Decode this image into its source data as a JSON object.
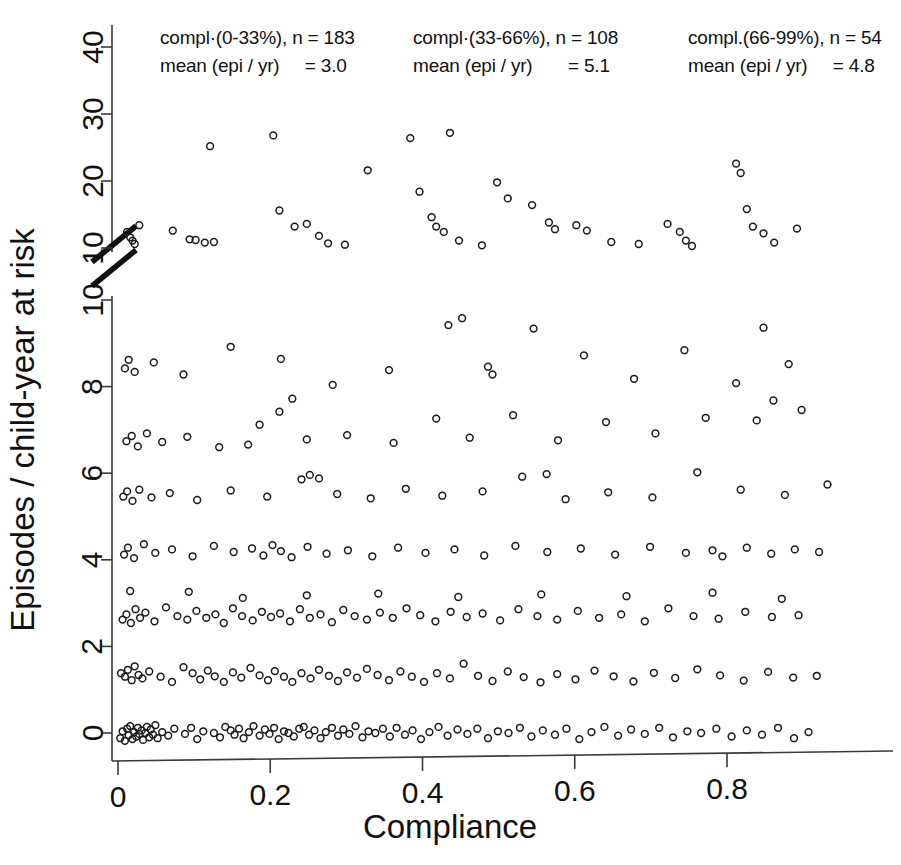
{
  "chart_data": {
    "type": "scatter",
    "title": "",
    "xlabel": "Compliance",
    "ylabel": "Episodes / child-year at risk",
    "xlim": [
      -0.03,
      1.0
    ],
    "xticks": [
      0,
      0.2,
      0.4,
      0.6,
      0.8
    ],
    "xticklabels": [
      "0",
      "0.2",
      "0.4",
      "0.6",
      "0.8"
    ],
    "ylim_lower": [
      0,
      10
    ],
    "ylim_upper": [
      10,
      42
    ],
    "yticks_lower": [
      0,
      2,
      4,
      6,
      8,
      10
    ],
    "yticklabels_lower": [
      "0",
      "2",
      "4",
      "6",
      "8",
      "10"
    ],
    "yticks_upper": [
      10,
      20,
      30,
      40
    ],
    "yticklabels_upper": [
      "10",
      "20",
      "30",
      "40"
    ],
    "axis_break": true,
    "axis_break_note": "broken y-axis between the lower 0-10 segment and the upper 10-40 segment",
    "grid": false,
    "legend": "none",
    "marker": "open-circle",
    "marker_size_px": 8,
    "groups": [
      {
        "name": "compl.(0-33%)",
        "label_line1": "compl·(0-33%), n = 183",
        "label_line2": "mean (epi / yr)     = 3.0",
        "n": 183,
        "mean_epi_per_yr": 3.0,
        "compliance_range": [
          0,
          0.33
        ]
      },
      {
        "name": "compl.(33-66%)",
        "label_line1": "compl·(33-66%), n = 108",
        "label_line2": "mean (epi / yr)       = 5.1",
        "n": 108,
        "mean_epi_per_yr": 5.1,
        "compliance_range": [
          0.33,
          0.66
        ]
      },
      {
        "name": "compl.(66-99%)",
        "label_line1": "compl.(66-99%), n = 54",
        "label_line2": "mean (epi / yr)     = 4.8",
        "n": 54,
        "mean_epi_per_yr": 4.8,
        "compliance_range": [
          0.66,
          0.99
        ]
      }
    ],
    "points": [
      [
        0.003,
        -0.12
      ],
      [
        0.006,
        0.04
      ],
      [
        0.009,
        -0.18
      ],
      [
        0.012,
        0.1
      ],
      [
        0.014,
        -0.05
      ],
      [
        0.016,
        0.16
      ],
      [
        0.019,
        -0.14
      ],
      [
        0.021,
        0.02
      ],
      [
        0.024,
        -0.08
      ],
      [
        0.026,
        0.12
      ],
      [
        0.028,
        -0.02
      ],
      [
        0.031,
        0.06
      ],
      [
        0.033,
        -0.16
      ],
      [
        0.036,
        0.0
      ],
      [
        0.038,
        0.14
      ],
      [
        0.041,
        -0.1
      ],
      [
        0.043,
        0.08
      ],
      [
        0.046,
        -0.04
      ],
      [
        0.049,
        0.18
      ],
      [
        0.052,
        -0.12
      ],
      [
        0.058,
        0.02
      ],
      [
        0.066,
        -0.06
      ],
      [
        0.074,
        0.1
      ],
      [
        0.088,
        -0.02
      ],
      [
        0.096,
        0.12
      ],
      [
        0.104,
        -0.14
      ],
      [
        0.112,
        0.04
      ],
      [
        0.126,
        0.0
      ],
      [
        0.134,
        -0.1
      ],
      [
        0.141,
        0.14
      ],
      [
        0.148,
        0.06
      ],
      [
        0.153,
        -0.04
      ],
      [
        0.159,
        0.1
      ],
      [
        0.165,
        -0.12
      ],
      [
        0.172,
        0.02
      ],
      [
        0.178,
        0.16
      ],
      [
        0.186,
        -0.06
      ],
      [
        0.193,
        0.08
      ],
      [
        0.199,
        -0.02
      ],
      [
        0.205,
        0.12
      ],
      [
        0.211,
        -0.14
      ],
      [
        0.218,
        0.04
      ],
      [
        0.224,
        0.0
      ],
      [
        0.231,
        -0.08
      ],
      [
        0.238,
        0.1
      ],
      [
        0.244,
        0.14
      ],
      [
        0.251,
        -0.04
      ],
      [
        0.258,
        0.06
      ],
      [
        0.266,
        -0.12
      ],
      [
        0.273,
        0.02
      ],
      [
        0.281,
        0.12
      ],
      [
        0.289,
        -0.06
      ],
      [
        0.296,
        0.08
      ],
      [
        0.304,
        -0.02
      ],
      [
        0.312,
        0.16
      ],
      [
        0.321,
        -0.1
      ],
      [
        0.329,
        0.04
      ],
      [
        0.338,
        0.0
      ],
      [
        0.348,
        0.1
      ],
      [
        0.357,
        -0.08
      ],
      [
        0.366,
        0.12
      ],
      [
        0.377,
        -0.04
      ],
      [
        0.387,
        0.06
      ],
      [
        0.398,
        -0.14
      ],
      [
        0.409,
        0.02
      ],
      [
        0.421,
        0.14
      ],
      [
        0.433,
        -0.06
      ],
      [
        0.446,
        0.08
      ],
      [
        0.459,
        -0.02
      ],
      [
        0.472,
        0.1
      ],
      [
        0.486,
        -0.12
      ],
      [
        0.499,
        0.04
      ],
      [
        0.513,
        0.0
      ],
      [
        0.528,
        0.12
      ],
      [
        0.543,
        -0.08
      ],
      [
        0.558,
        0.06
      ],
      [
        0.574,
        -0.04
      ],
      [
        0.589,
        0.1
      ],
      [
        0.606,
        -0.14
      ],
      [
        0.622,
        0.02
      ],
      [
        0.639,
        0.14
      ],
      [
        0.657,
        -0.06
      ],
      [
        0.674,
        0.08
      ],
      [
        0.692,
        -0.02
      ],
      [
        0.711,
        0.12
      ],
      [
        0.729,
        -0.1
      ],
      [
        0.748,
        0.04
      ],
      [
        0.766,
        0.0
      ],
      [
        0.786,
        0.1
      ],
      [
        0.806,
        -0.08
      ],
      [
        0.826,
        0.06
      ],
      [
        0.846,
        -0.04
      ],
      [
        0.867,
        0.12
      ],
      [
        0.888,
        -0.12
      ],
      [
        0.907,
        0.02
      ],
      [
        0.004,
        1.38
      ],
      [
        0.009,
        1.3
      ],
      [
        0.013,
        1.46
      ],
      [
        0.018,
        1.22
      ],
      [
        0.022,
        1.54
      ],
      [
        0.027,
        1.34
      ],
      [
        0.032,
        1.26
      ],
      [
        0.041,
        1.42
      ],
      [
        0.056,
        1.3
      ],
      [
        0.071,
        1.18
      ],
      [
        0.086,
        1.52
      ],
      [
        0.098,
        1.38
      ],
      [
        0.108,
        1.24
      ],
      [
        0.118,
        1.44
      ],
      [
        0.127,
        1.31
      ],
      [
        0.139,
        1.18
      ],
      [
        0.151,
        1.4
      ],
      [
        0.162,
        1.28
      ],
      [
        0.174,
        1.5
      ],
      [
        0.186,
        1.33
      ],
      [
        0.197,
        1.22
      ],
      [
        0.206,
        1.43
      ],
      [
        0.218,
        1.3
      ],
      [
        0.229,
        1.18
      ],
      [
        0.241,
        1.38
      ],
      [
        0.253,
        1.26
      ],
      [
        0.264,
        1.46
      ],
      [
        0.277,
        1.32
      ],
      [
        0.289,
        1.2
      ],
      [
        0.301,
        1.4
      ],
      [
        0.314,
        1.28
      ],
      [
        0.327,
        1.48
      ],
      [
        0.341,
        1.34
      ],
      [
        0.356,
        1.22
      ],
      [
        0.371,
        1.42
      ],
      [
        0.386,
        1.3
      ],
      [
        0.402,
        1.18
      ],
      [
        0.419,
        1.38
      ],
      [
        0.436,
        1.26
      ],
      [
        0.454,
        1.6
      ],
      [
        0.473,
        1.32
      ],
      [
        0.492,
        1.2
      ],
      [
        0.512,
        1.42
      ],
      [
        0.533,
        1.29
      ],
      [
        0.555,
        1.17
      ],
      [
        0.577,
        1.36
      ],
      [
        0.601,
        1.24
      ],
      [
        0.626,
        1.44
      ],
      [
        0.651,
        1.31
      ],
      [
        0.677,
        1.19
      ],
      [
        0.704,
        1.39
      ],
      [
        0.732,
        1.27
      ],
      [
        0.761,
        1.47
      ],
      [
        0.791,
        1.33
      ],
      [
        0.822,
        1.21
      ],
      [
        0.854,
        1.41
      ],
      [
        0.887,
        1.28
      ],
      [
        0.918,
        1.32
      ],
      [
        0.006,
        2.62
      ],
      [
        0.011,
        2.74
      ],
      [
        0.017,
        2.54
      ],
      [
        0.023,
        2.86
      ],
      [
        0.029,
        2.66
      ],
      [
        0.036,
        2.78
      ],
      [
        0.048,
        2.58
      ],
      [
        0.063,
        2.9
      ],
      [
        0.078,
        2.7
      ],
      [
        0.091,
        2.62
      ],
      [
        0.103,
        2.82
      ],
      [
        0.116,
        2.66
      ],
      [
        0.128,
        2.74
      ],
      [
        0.139,
        2.54
      ],
      [
        0.151,
        2.88
      ],
      [
        0.163,
        2.7
      ],
      [
        0.177,
        2.6
      ],
      [
        0.189,
        2.8
      ],
      [
        0.201,
        2.68
      ],
      [
        0.213,
        2.76
      ],
      [
        0.226,
        2.58
      ],
      [
        0.239,
        2.86
      ],
      [
        0.252,
        2.66
      ],
      [
        0.266,
        2.74
      ],
      [
        0.281,
        2.56
      ],
      [
        0.296,
        2.84
      ],
      [
        0.311,
        2.7
      ],
      [
        0.327,
        2.62
      ],
      [
        0.344,
        2.78
      ],
      [
        0.361,
        2.66
      ],
      [
        0.379,
        2.88
      ],
      [
        0.397,
        2.72
      ],
      [
        0.417,
        2.58
      ],
      [
        0.437,
        2.8
      ],
      [
        0.458,
        2.68
      ],
      [
        0.479,
        2.76
      ],
      [
        0.502,
        2.6
      ],
      [
        0.526,
        2.86
      ],
      [
        0.551,
        2.7
      ],
      [
        0.577,
        2.62
      ],
      [
        0.604,
        2.82
      ],
      [
        0.632,
        2.66
      ],
      [
        0.661,
        2.74
      ],
      [
        0.692,
        2.58
      ],
      [
        0.723,
        2.88
      ],
      [
        0.756,
        2.7
      ],
      [
        0.789,
        2.64
      ],
      [
        0.824,
        2.8
      ],
      [
        0.859,
        2.68
      ],
      [
        0.894,
        2.72
      ],
      [
        0.016,
        3.28
      ],
      [
        0.093,
        3.26
      ],
      [
        0.164,
        3.12
      ],
      [
        0.248,
        3.18
      ],
      [
        0.342,
        3.22
      ],
      [
        0.447,
        3.14
      ],
      [
        0.556,
        3.2
      ],
      [
        0.668,
        3.16
      ],
      [
        0.781,
        3.24
      ],
      [
        0.872,
        3.1
      ],
      [
        0.008,
        4.12
      ],
      [
        0.013,
        4.28
      ],
      [
        0.021,
        4.04
      ],
      [
        0.034,
        4.36
      ],
      [
        0.049,
        4.16
      ],
      [
        0.071,
        4.24
      ],
      [
        0.098,
        4.08
      ],
      [
        0.126,
        4.32
      ],
      [
        0.152,
        4.18
      ],
      [
        0.176,
        4.26
      ],
      [
        0.191,
        4.1
      ],
      [
        0.203,
        4.34
      ],
      [
        0.214,
        4.2
      ],
      [
        0.228,
        4.06
      ],
      [
        0.249,
        4.3
      ],
      [
        0.274,
        4.14
      ],
      [
        0.302,
        4.22
      ],
      [
        0.334,
        4.08
      ],
      [
        0.368,
        4.28
      ],
      [
        0.404,
        4.16
      ],
      [
        0.442,
        4.24
      ],
      [
        0.481,
        4.1
      ],
      [
        0.522,
        4.32
      ],
      [
        0.564,
        4.18
      ],
      [
        0.608,
        4.26
      ],
      [
        0.653,
        4.12
      ],
      [
        0.699,
        4.3
      ],
      [
        0.746,
        4.16
      ],
      [
        0.781,
        4.22
      ],
      [
        0.794,
        4.08
      ],
      [
        0.826,
        4.28
      ],
      [
        0.858,
        4.14
      ],
      [
        0.889,
        4.24
      ],
      [
        0.921,
        4.18
      ],
      [
        0.007,
        5.46
      ],
      [
        0.012,
        5.58
      ],
      [
        0.019,
        5.36
      ],
      [
        0.028,
        5.62
      ],
      [
        0.044,
        5.44
      ],
      [
        0.068,
        5.54
      ],
      [
        0.104,
        5.38
      ],
      [
        0.148,
        5.6
      ],
      [
        0.196,
        5.46
      ],
      [
        0.241,
        5.86
      ],
      [
        0.252,
        5.96
      ],
      [
        0.264,
        5.88
      ],
      [
        0.288,
        5.52
      ],
      [
        0.332,
        5.42
      ],
      [
        0.378,
        5.64
      ],
      [
        0.426,
        5.48
      ],
      [
        0.479,
        5.58
      ],
      [
        0.531,
        5.92
      ],
      [
        0.563,
        5.98
      ],
      [
        0.588,
        5.4
      ],
      [
        0.644,
        5.56
      ],
      [
        0.702,
        5.44
      ],
      [
        0.761,
        6.02
      ],
      [
        0.818,
        5.62
      ],
      [
        0.876,
        5.5
      ],
      [
        0.932,
        5.74
      ],
      [
        0.011,
        6.74
      ],
      [
        0.018,
        6.86
      ],
      [
        0.026,
        6.62
      ],
      [
        0.038,
        6.92
      ],
      [
        0.058,
        6.72
      ],
      [
        0.091,
        6.84
      ],
      [
        0.133,
        6.6
      ],
      [
        0.171,
        6.66
      ],
      [
        0.186,
        7.12
      ],
      [
        0.212,
        7.42
      ],
      [
        0.229,
        7.72
      ],
      [
        0.248,
        6.78
      ],
      [
        0.301,
        6.88
      ],
      [
        0.362,
        6.7
      ],
      [
        0.418,
        7.26
      ],
      [
        0.462,
        6.82
      ],
      [
        0.519,
        7.34
      ],
      [
        0.578,
        6.76
      ],
      [
        0.641,
        7.18
      ],
      [
        0.706,
        6.92
      ],
      [
        0.772,
        7.28
      ],
      [
        0.839,
        7.22
      ],
      [
        0.861,
        7.68
      ],
      [
        0.898,
        7.46
      ],
      [
        0.009,
        8.42
      ],
      [
        0.014,
        8.62
      ],
      [
        0.022,
        8.34
      ],
      [
        0.047,
        8.56
      ],
      [
        0.086,
        8.28
      ],
      [
        0.148,
        8.92
      ],
      [
        0.214,
        8.64
      ],
      [
        0.282,
        8.04
      ],
      [
        0.356,
        8.38
      ],
      [
        0.434,
        9.42
      ],
      [
        0.452,
        9.58
      ],
      [
        0.486,
        8.46
      ],
      [
        0.492,
        8.28
      ],
      [
        0.546,
        9.34
      ],
      [
        0.612,
        8.72
      ],
      [
        0.678,
        8.18
      ],
      [
        0.744,
        8.84
      ],
      [
        0.812,
        8.08
      ],
      [
        0.848,
        9.36
      ],
      [
        0.881,
        8.52
      ],
      [
        0.012,
        12.4
      ],
      [
        0.016,
        11.6
      ],
      [
        0.019,
        11.1
      ],
      [
        0.022,
        10.6
      ],
      [
        0.028,
        13.4
      ],
      [
        0.072,
        12.6
      ],
      [
        0.094,
        11.3
      ],
      [
        0.102,
        11.2
      ],
      [
        0.114,
        10.8
      ],
      [
        0.121,
        25.2
      ],
      [
        0.126,
        10.9
      ],
      [
        0.204,
        26.8
      ],
      [
        0.212,
        15.6
      ],
      [
        0.232,
        13.2
      ],
      [
        0.248,
        13.6
      ],
      [
        0.264,
        11.8
      ],
      [
        0.276,
        10.7
      ],
      [
        0.298,
        10.5
      ],
      [
        0.328,
        21.6
      ],
      [
        0.384,
        26.4
      ],
      [
        0.396,
        18.4
      ],
      [
        0.412,
        14.6
      ],
      [
        0.418,
        13.2
      ],
      [
        0.428,
        12.4
      ],
      [
        0.436,
        27.2
      ],
      [
        0.448,
        11.1
      ],
      [
        0.478,
        10.4
      ],
      [
        0.498,
        19.8
      ],
      [
        0.512,
        17.4
      ],
      [
        0.544,
        16.4
      ],
      [
        0.566,
        13.8
      ],
      [
        0.574,
        12.8
      ],
      [
        0.602,
        13.4
      ],
      [
        0.616,
        12.6
      ],
      [
        0.648,
        10.9
      ],
      [
        0.684,
        10.6
      ],
      [
        0.722,
        13.6
      ],
      [
        0.738,
        12.4
      ],
      [
        0.746,
        11.1
      ],
      [
        0.754,
        10.3
      ],
      [
        0.812,
        22.6
      ],
      [
        0.818,
        21.2
      ],
      [
        0.826,
        15.8
      ],
      [
        0.834,
        13.2
      ],
      [
        0.848,
        12.2
      ],
      [
        0.862,
        10.8
      ],
      [
        0.892,
        12.9
      ]
    ],
    "annotations": [
      {
        "x_px": 160,
        "y_px": 44,
        "text": "compl·(0-33%), n = 183"
      },
      {
        "x_px": 160,
        "y_px": 72,
        "text": "mean (epi / yr)     = 3.0"
      },
      {
        "x_px": 413,
        "y_px": 44,
        "text": "compl·(33-66%), n = 108"
      },
      {
        "x_px": 413,
        "y_px": 72,
        "text": "mean (epi / yr)       = 5.1"
      },
      {
        "x_px": 688,
        "y_px": 44,
        "text": "compl.(66-99%), n = 54"
      },
      {
        "x_px": 688,
        "y_px": 72,
        "text": "mean (epi / yr)     = 4.8"
      }
    ]
  }
}
